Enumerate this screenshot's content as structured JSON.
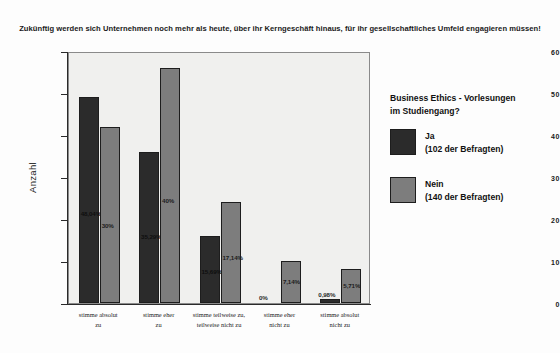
{
  "chart_data": {
    "type": "bar",
    "title": "Zukünftig werden sich Unternehmen noch mehr als heute, über ihr Kerngeschäft hinaus, für ihr gesellschaftliches Umfeld engagieren müssen!",
    "xlabel": "",
    "ylabel": "Anzahl",
    "ylim": [
      0,
      60
    ],
    "yticks": [
      "0",
      "10",
      "20",
      "30",
      "40",
      "50",
      "60"
    ],
    "grid": false,
    "legend_position": "right",
    "categories": [
      "stimme absolut zu",
      "stimme eher zu",
      "stimme teilweise zu, teilweise nicht zu",
      "stimme eher nicht zu",
      "stimme absolut nicht zu"
    ],
    "category_lines": [
      [
        "stimme absolut",
        "zu"
      ],
      [
        "stimme eher",
        "zu"
      ],
      [
        "stimme teilweise zu,",
        "teilweise nicht zu"
      ],
      [
        "stimme eher",
        "nicht zu"
      ],
      [
        "stimme absolut",
        "nicht zu"
      ]
    ],
    "series": [
      {
        "name": "Ja",
        "legend_label": "Ja",
        "legend_sub": "(102 der Befragten)",
        "color": "#2b2b2b",
        "values": [
          49,
          36,
          16,
          0,
          1
        ],
        "labels": [
          "48,04%",
          "35,29%",
          "15,69%",
          "0%",
          "0,98%"
        ]
      },
      {
        "name": "Nein",
        "legend_label": "Nein",
        "legend_sub": "(140 der Befragten)",
        "color": "#7d7d7d",
        "values": [
          42,
          56,
          24,
          10,
          8
        ],
        "labels": [
          "30%",
          "40%",
          "17,14%",
          "7,14%",
          "5,71%"
        ]
      }
    ]
  },
  "legend": {
    "title_line1": "Business Ethics - Vorlesungen",
    "title_line2": "im Studiengang?"
  }
}
